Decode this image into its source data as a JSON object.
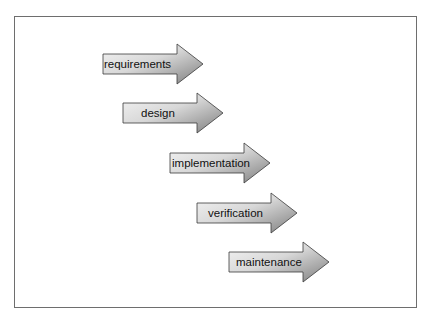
{
  "diagram": {
    "type": "waterfall-process",
    "steps": [
      {
        "label": "requirements",
        "x": 103,
        "y": 54,
        "text_x": 104
      },
      {
        "label": "design",
        "x": 123,
        "y": 103,
        "text_x": 141
      },
      {
        "label": "implementation",
        "x": 170,
        "y": 153,
        "text_x": 172
      },
      {
        "label": "verification",
        "x": 197,
        "y": 203,
        "text_x": 208
      },
      {
        "label": "maintenance",
        "x": 229,
        "y": 252,
        "text_x": 236
      }
    ],
    "colors": {
      "arrow_light": "#f2f2f2",
      "arrow_dark": "#8a8a8a",
      "arrow_stroke": "#3a3a3a",
      "frame": "#6e6e6e"
    }
  }
}
